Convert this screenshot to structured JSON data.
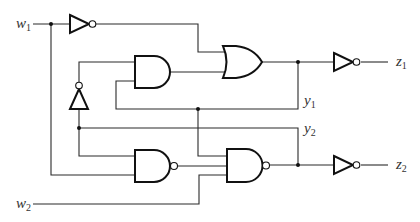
{
  "diagram": {
    "type": "sequential logic circuit",
    "inputs": [
      {
        "name": "w",
        "sub": "1"
      },
      {
        "name": "w",
        "sub": "2"
      }
    ],
    "outputs": [
      {
        "name": "z",
        "sub": "1"
      },
      {
        "name": "z",
        "sub": "2"
      }
    ],
    "state_variables": [
      {
        "name": "y",
        "sub": "1"
      },
      {
        "name": "y",
        "sub": "2"
      }
    ],
    "gates": [
      {
        "id": "inv_w1",
        "type": "NOT"
      },
      {
        "id": "inv_feedback",
        "type": "NOT"
      },
      {
        "id": "and1",
        "type": "AND"
      },
      {
        "id": "or1",
        "type": "OR"
      },
      {
        "id": "inv_z1",
        "type": "NOT"
      },
      {
        "id": "nand1",
        "type": "NAND"
      },
      {
        "id": "nand2",
        "type": "NAND"
      },
      {
        "id": "inv_z2",
        "type": "NOT"
      }
    ],
    "colors": {
      "line": "#111111",
      "background": "#ffffff"
    }
  }
}
